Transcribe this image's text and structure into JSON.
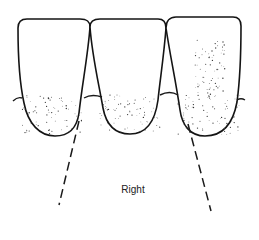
{
  "figure": {
    "label": "Right",
    "colors": {
      "ink": "#141414",
      "background": "#ffffff"
    }
  }
}
